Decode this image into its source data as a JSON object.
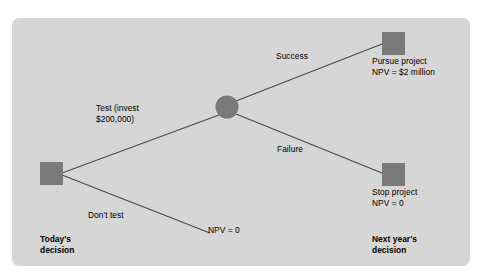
{
  "diagram": {
    "panel_color": "#d6d6d6",
    "node_color": "#7a7a7a",
    "line_color": "#4a4a4a",
    "nodes": {
      "root_decision": {
        "type": "decision-square",
        "x": 38,
        "y": 144
      },
      "chance": {
        "type": "chance-circle",
        "x": 215,
        "y": 89
      },
      "pursue_decision": {
        "type": "decision-square",
        "x": 370,
        "y": 14
      },
      "stop_decision": {
        "type": "decision-square",
        "x": 370,
        "y": 145
      }
    },
    "branches": [
      {
        "id": "test",
        "label": "Test (invest\n$200,000)"
      },
      {
        "id": "dont-test",
        "label": "Don't test"
      },
      {
        "id": "success",
        "label": "Success"
      },
      {
        "id": "failure",
        "label": "Failure"
      }
    ],
    "outcomes": [
      {
        "id": "dont-test-outcome",
        "label": "NPV = 0"
      },
      {
        "id": "pursue-outcome",
        "label": "Pursue project\nNPV = $2 million"
      },
      {
        "id": "stop-outcome",
        "label": "Stop project\nNPV = 0"
      }
    ],
    "stage_labels": {
      "left": "Today's\ndecision",
      "right": "Next year's\ndecision"
    }
  }
}
